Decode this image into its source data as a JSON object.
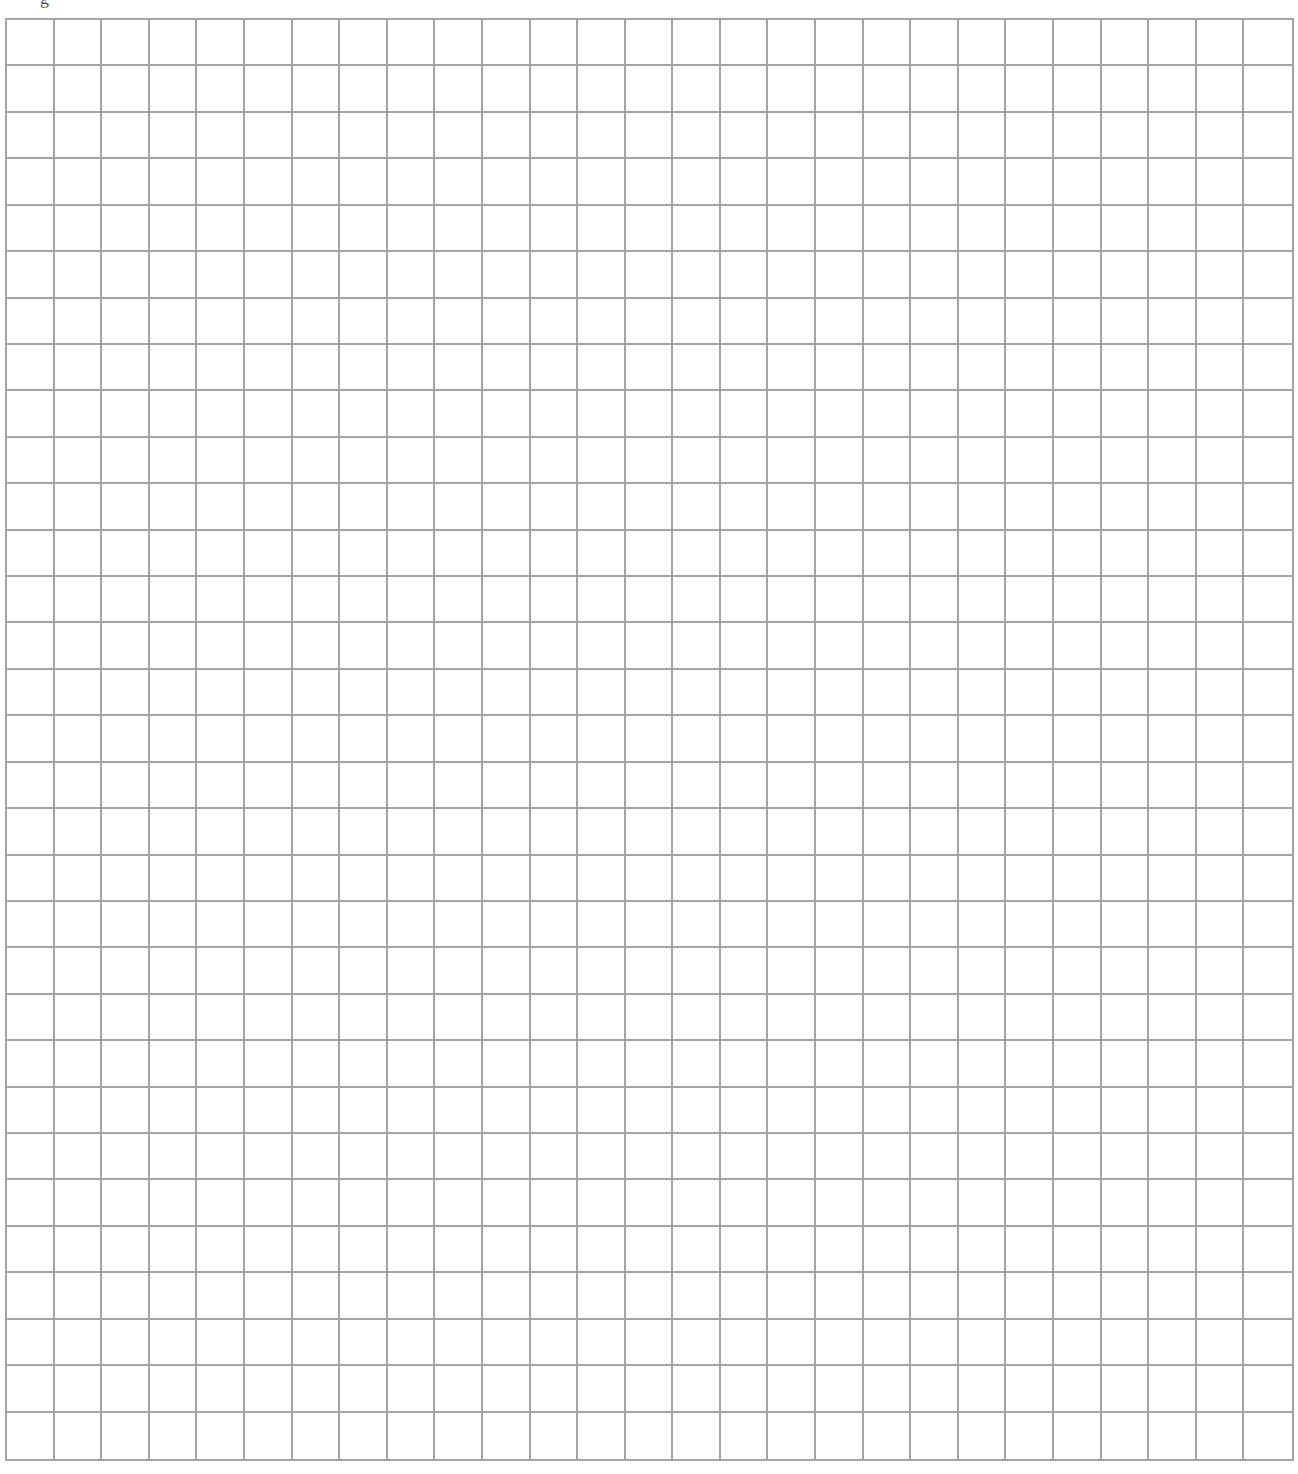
{
  "page": {
    "caption_fragment": "g"
  },
  "grid": {
    "columns": 27,
    "rows": 31,
    "line_color": "#a3a3a3",
    "background_color": "#ffffff"
  }
}
